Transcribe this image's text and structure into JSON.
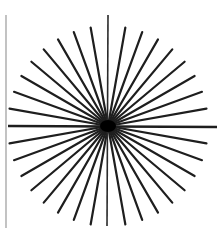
{
  "diagram": {
    "type": "radial-starburst",
    "center": {
      "x": 108,
      "y": 126
    },
    "ray_radius": 100,
    "ray_count": 36,
    "angle_step_deg": 10,
    "ray_color": "#1e1e1e",
    "ray_width": 2.2,
    "center_blob_radius": 7,
    "axes": {
      "horizontal": {
        "x1": 8,
        "y1": 126,
        "x2": 217,
        "y2": 127,
        "width": 2.4,
        "color": "#1e1e1e"
      },
      "vertical": {
        "x1": 108,
        "y1": 15,
        "x2": 107,
        "y2": 226,
        "width": 1.6,
        "color": "#2a2a2a"
      }
    },
    "left_border": {
      "x": 6,
      "y1": 15,
      "y2": 228,
      "width": 1.2,
      "color": "#9a9a9a"
    }
  }
}
